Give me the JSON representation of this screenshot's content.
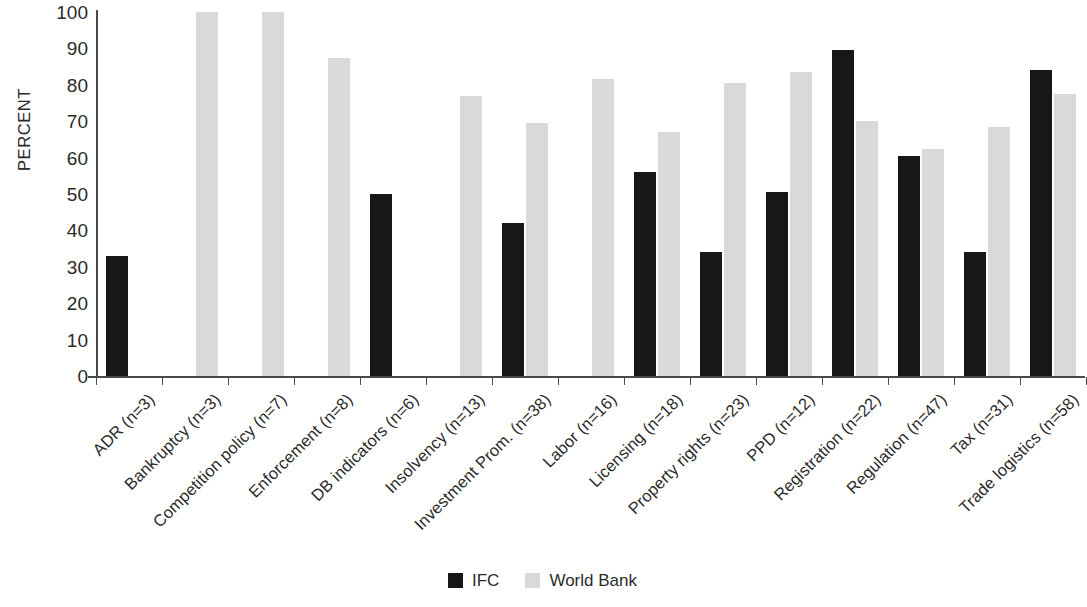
{
  "chart_data": {
    "type": "bar",
    "title": "",
    "xlabel": "",
    "ylabel": "PERCENT",
    "ylim": [
      0,
      100
    ],
    "ytick_step": 10,
    "yticks": [
      100,
      90,
      80,
      70,
      60,
      50,
      40,
      30,
      20,
      10,
      0
    ],
    "grid": false,
    "legend_position": "bottom-center",
    "categories": [
      "ADR (n=3)",
      "Bankruptcy (n=3)",
      "Competition policy (n=7)",
      "Enforcement (n=8)",
      "DB indicators (n=6)",
      "Insolvency (n=13)",
      "Investment Prom. (n=38)",
      "Labor (n=16)",
      "Licensing (n=18)",
      "Property rights (n=23)",
      "PPD (n=12)",
      "Registration (n=22)",
      "Regulation (n=47)",
      "Tax (n=31)",
      "Trade logistics (n=58)"
    ],
    "series": [
      {
        "name": "IFC",
        "color": "#171717",
        "values": [
          33,
          0,
          0,
          0,
          50,
          0,
          42,
          0,
          56,
          34,
          50.5,
          89.5,
          60.5,
          34,
          84
        ]
      },
      {
        "name": "World Bank",
        "color": "#d9d9d9",
        "values": [
          0,
          100,
          100,
          87.5,
          0,
          77,
          69.5,
          81.5,
          67,
          80.5,
          83.5,
          70,
          62.5,
          68.5,
          77.5
        ]
      }
    ]
  },
  "legend": {
    "items": [
      {
        "label": "IFC",
        "color": "#171717"
      },
      {
        "label": "World Bank",
        "color": "#d9d9d9"
      }
    ]
  },
  "axis": {
    "y_title": "PERCENT"
  }
}
